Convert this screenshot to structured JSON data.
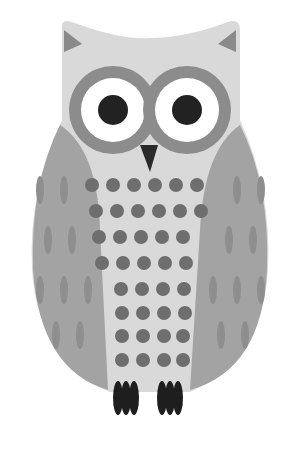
{
  "image": {
    "subject": "owl illustration",
    "background": "#ffffff"
  },
  "colors": {
    "body_light": "#d9d9d9",
    "wing": "#a3a3a3",
    "wing_streak": "#8e8e8e",
    "ear_tip": "#8a8a8a",
    "eye_ring": "#8c8c8c",
    "eye_white": "#ffffff",
    "pupil": "#222222",
    "beak": "#2a2a2a",
    "chest_dot": "#6e6e6e",
    "feet": "#1e1e1e"
  },
  "owl": {
    "eyes": [
      {
        "cx": 113,
        "cy": 110
      },
      {
        "cx": 187,
        "cy": 110
      }
    ],
    "chest_rows": [
      {
        "y": 185,
        "xs": [
          92,
          113,
          134,
          155,
          176,
          197
        ]
      },
      {
        "y": 211,
        "xs": [
          96,
          117,
          138,
          159,
          180,
          201
        ]
      },
      {
        "y": 237,
        "xs": [
          99,
          120,
          141,
          162,
          183
        ]
      },
      {
        "y": 263,
        "xs": [
          102,
          123,
          144,
          165,
          186
        ]
      },
      {
        "y": 289,
        "xs": [
          121,
          142,
          163,
          184
        ]
      },
      {
        "y": 313,
        "xs": [
          122,
          143,
          164,
          185
        ]
      },
      {
        "y": 336,
        "xs": [
          122,
          143,
          164,
          183
        ]
      },
      {
        "y": 360,
        "xs": [
          122,
          143,
          164,
          183
        ]
      }
    ],
    "left_feet_x": 126,
    "right_feet_x": 170
  }
}
